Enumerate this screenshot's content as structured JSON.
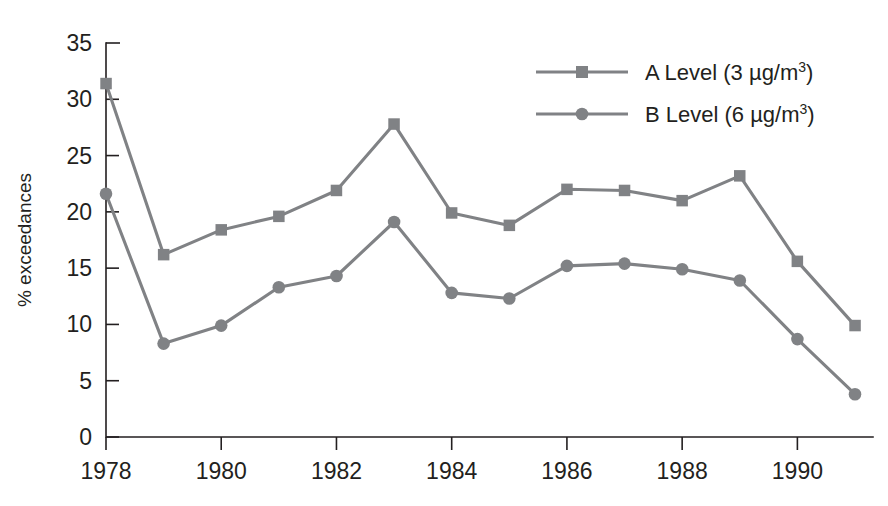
{
  "chart_data": {
    "type": "line",
    "title": "",
    "xlabel": "",
    "ylabel": "% exceedances",
    "categories": [
      1978,
      1979,
      1980,
      1981,
      1982,
      1983,
      1984,
      1985,
      1986,
      1987,
      1988,
      1989,
      1990,
      1991
    ],
    "x_tick_labels": [
      "1978",
      "1980",
      "1982",
      "1984",
      "1986",
      "1988",
      "1990"
    ],
    "x_tick_values": [
      1978,
      1980,
      1982,
      1984,
      1986,
      1988,
      1990
    ],
    "xlim": [
      1978,
      1991
    ],
    "y_tick_labels": [
      "0",
      "5",
      "10",
      "15",
      "20",
      "25",
      "30",
      "35"
    ],
    "y_tick_values": [
      0,
      5,
      10,
      15,
      20,
      25,
      30,
      35
    ],
    "ylim": [
      0,
      35
    ],
    "grid": false,
    "legend_position": "top-right",
    "series": [
      {
        "name": "A Level (3 µg/m3)",
        "label_main": "A Level (3 µg/m",
        "label_sup": "3",
        "label_tail": ")",
        "marker": "square",
        "color": "#808285",
        "values": [
          31.4,
          16.2,
          18.4,
          19.6,
          21.9,
          27.8,
          19.9,
          18.8,
          22.0,
          21.9,
          21.0,
          23.2,
          15.6,
          9.9
        ]
      },
      {
        "name": "B Level (6 µg/m3)",
        "label_main": "B Level (6 µg/m",
        "label_sup": "3",
        "label_tail": ")",
        "marker": "circle",
        "color": "#808285",
        "values": [
          21.6,
          8.3,
          9.9,
          13.3,
          14.3,
          19.1,
          12.8,
          12.3,
          15.2,
          15.4,
          14.9,
          13.9,
          8.7,
          3.8
        ]
      }
    ]
  },
  "colors": {
    "series": "#808285",
    "axis": "#231f20",
    "background": "#ffffff"
  }
}
